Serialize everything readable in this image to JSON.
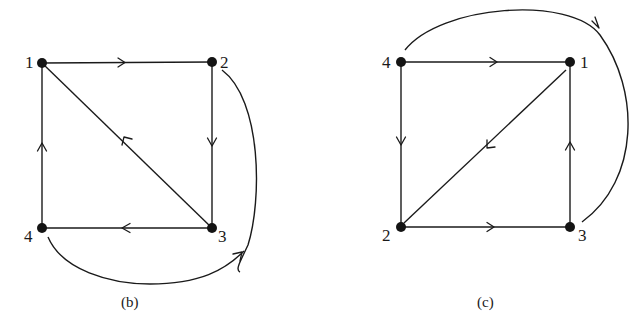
{
  "figure": {
    "panels": [
      {
        "id": "b",
        "caption": "(b)",
        "nodes": [
          {
            "id": "1",
            "label": "1"
          },
          {
            "id": "2",
            "label": "2"
          },
          {
            "id": "3",
            "label": "3"
          },
          {
            "id": "4",
            "label": "4"
          }
        ],
        "edges": [
          {
            "from": "1",
            "to": "2",
            "shape": "straight"
          },
          {
            "from": "2",
            "to": "3",
            "shape": "straight"
          },
          {
            "from": "3",
            "to": "4",
            "shape": "straight"
          },
          {
            "from": "4",
            "to": "1",
            "shape": "straight"
          },
          {
            "from": "3",
            "to": "1",
            "shape": "diagonal"
          },
          {
            "from": "4",
            "to": "3",
            "shape": "curved-below-right"
          },
          {
            "from": "2",
            "to": "3",
            "shape": "curved-right-undirected-segment"
          }
        ]
      },
      {
        "id": "c",
        "caption": "(c)",
        "nodes": [
          {
            "id": "4",
            "label": "4"
          },
          {
            "id": "1",
            "label": "1"
          },
          {
            "id": "2",
            "label": "2"
          },
          {
            "id": "3",
            "label": "3"
          }
        ],
        "edges": [
          {
            "from": "4",
            "to": "1",
            "shape": "straight"
          },
          {
            "from": "4",
            "to": "2",
            "shape": "straight"
          },
          {
            "from": "2",
            "to": "3",
            "shape": "straight"
          },
          {
            "from": "3",
            "to": "1",
            "shape": "straight"
          },
          {
            "from": "1",
            "to": "2",
            "shape": "diagonal"
          },
          {
            "from": "3",
            "to": "4",
            "shape": "curved-above-right"
          }
        ]
      }
    ]
  }
}
